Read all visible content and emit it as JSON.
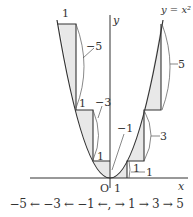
{
  "diagram": {
    "curve_label": "y = x²",
    "axis_labels": {
      "x": "x",
      "y": "y",
      "origin": "O"
    },
    "tick_labels": {
      "x_one": "1"
    },
    "right_steps": [
      {
        "width_label": "1",
        "rise_label": "1"
      },
      {
        "rise_label": "3"
      },
      {
        "rise_label": "5"
      }
    ],
    "left_steps": [
      {
        "width_label": "1",
        "rise_label": "−1"
      },
      {
        "width_label": "1",
        "rise_label": "−3"
      },
      {
        "width_label": "1",
        "rise_label": "−5"
      }
    ],
    "caption": "−5 ← −3 ← −1 ←,  → 1 → 3 → 5",
    "colors": {
      "line": "#333333",
      "shade": "#e6e6e6",
      "background": "#ffffff"
    }
  }
}
